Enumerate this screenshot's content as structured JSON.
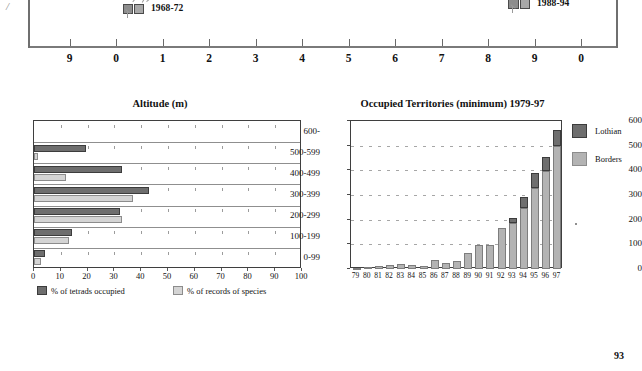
{
  "page": {
    "number": "93"
  },
  "top_panel": {
    "corner_mark": "/",
    "maps": [
      {
        "label": "1968-72"
      },
      {
        "label": "1988-94"
      }
    ],
    "year_axis": {
      "ticks": [
        "9",
        "0",
        "1",
        "2",
        "3",
        "4",
        "5",
        "6",
        "7",
        "8",
        "9",
        "0"
      ]
    }
  },
  "charts": {
    "altitude": {
      "title": "Altitude (m)",
      "legend": [
        {
          "label": "% of tetrads occupied",
          "color": "#6e6e6e"
        },
        {
          "label": "% of records of species",
          "color": "#d4d4d4"
        }
      ]
    },
    "occupied": {
      "title": "Occupied Territories (minimum) 1979-97",
      "legend": [
        {
          "label": "Lothian",
          "color": "#6e6e6e"
        },
        {
          "label": "Borders",
          "color": "#b3b3b3"
        }
      ]
    }
  },
  "chart_data": [
    {
      "type": "bar",
      "orientation": "horizontal",
      "title": "Altitude (m)",
      "xlabel": "",
      "ylabel": "",
      "xlim": [
        0,
        100
      ],
      "ylim": null,
      "grid": true,
      "legend_position": "bottom",
      "categories": [
        "600-",
        "500-599",
        "400-499",
        "300-399",
        "200-299",
        "100-199",
        "0-99"
      ],
      "xticks": [
        0,
        10,
        20,
        30,
        40,
        50,
        60,
        70,
        80,
        90,
        100
      ],
      "series": [
        {
          "name": "% of tetrads occupied",
          "color": "#6e6e6e",
          "values": [
            0,
            19.5,
            33,
            43,
            32,
            14,
            4
          ]
        },
        {
          "name": "% of records of species",
          "color": "#d4d4d4",
          "values": [
            0,
            1.5,
            12,
            37,
            33,
            13,
            2.5
          ]
        }
      ]
    },
    {
      "type": "bar",
      "orientation": "vertical",
      "stacked": true,
      "title": "Occupied Territories (minimum) 1979-97",
      "xlabel": "",
      "ylabel": "",
      "ylim": [
        0,
        600
      ],
      "yticks": [
        0,
        100,
        200,
        300,
        400,
        500,
        600
      ],
      "grid": true,
      "legend_position": "right",
      "categories": [
        "79",
        "80",
        "81",
        "82",
        "83",
        "84",
        "85",
        "86",
        "87",
        "88",
        "89",
        "90",
        "91",
        "92",
        "93",
        "94",
        "95",
        "96",
        "97"
      ],
      "series": [
        {
          "name": "Borders",
          "color": "#b3b3b3",
          "values": [
            3,
            10,
            12,
            17,
            22,
            15,
            12,
            36,
            24,
            32,
            65,
            97,
            98,
            165,
            185,
            248,
            330,
            397,
            500
          ]
        },
        {
          "name": "Lothian",
          "color": "#6e6e6e",
          "values": [
            0,
            0,
            0,
            0,
            0,
            0,
            0,
            0,
            0,
            0,
            0,
            0,
            0,
            0,
            23,
            42,
            58,
            58,
            62
          ]
        }
      ],
      "totals": [
        3,
        10,
        12,
        17,
        22,
        15,
        12,
        36,
        24,
        32,
        65,
        97,
        98,
        165,
        208,
        290,
        388,
        455,
        562
      ]
    }
  ]
}
